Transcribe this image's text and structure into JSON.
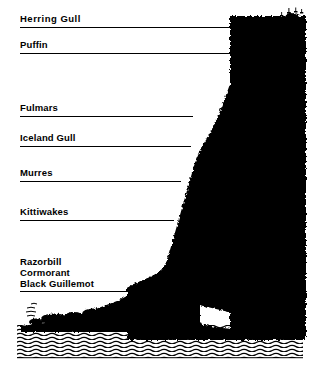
{
  "figure": {
    "colors": {
      "ink": "#000000",
      "paper": "#ffffff",
      "cliff": "#000000",
      "water_hatch": "#000000"
    }
  },
  "zones": [
    {
      "id": "herring-gull",
      "label": "Herring Gull",
      "label_x": 20,
      "label_y": 14,
      "line_y": 27,
      "line_x1": 20,
      "line_x2": 272,
      "wide_spacing": true
    },
    {
      "id": "puffin",
      "label": "Puffin",
      "label_x": 20,
      "label_y": 40,
      "line_y": 53,
      "line_x1": 20,
      "line_x2": 233,
      "wide_spacing": false
    },
    {
      "id": "fulmars",
      "label": "Fulmars",
      "label_x": 20,
      "label_y": 103,
      "line_y": 116,
      "line_x1": 20,
      "line_x2": 193,
      "wide_spacing": false
    },
    {
      "id": "iceland-gull",
      "label": "Iceland Gull",
      "label_x": 20,
      "label_y": 133,
      "line_y": 146,
      "line_x1": 20,
      "line_x2": 191,
      "wide_spacing": false
    },
    {
      "id": "murres",
      "label": "Murres",
      "label_x": 20,
      "label_y": 168,
      "line_y": 181,
      "line_x1": 20,
      "line_x2": 181,
      "wide_spacing": false
    },
    {
      "id": "kittiwakes",
      "label": "Kittiwakes",
      "label_x": 20,
      "label_y": 207,
      "line_y": 220,
      "line_x1": 20,
      "line_x2": 174,
      "wide_spacing": false
    }
  ],
  "grouped_zone": {
    "id": "razorbill-cormorant-black-guillemot",
    "labels": [
      "Razorbill",
      "Cormorant",
      "Black Guillemot"
    ],
    "label_x": 20,
    "label_y": 256,
    "line_y": 291,
    "line_x1": 20,
    "line_x2": 140
  },
  "water": {
    "id": "sea",
    "x1": 17,
    "x2": 303,
    "y1": 325,
    "y2": 358
  }
}
